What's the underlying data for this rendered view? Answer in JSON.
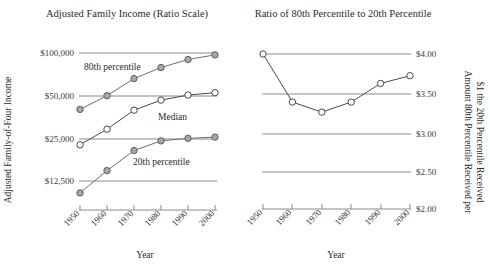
{
  "figure": {
    "left_panel": {
      "title": "Adjusted Family Income (Ratio Scale)",
      "ylabel": "Adjusted Family-of-Four Income",
      "xlabel": "Year"
    },
    "right_panel": {
      "title": "Ratio of 80th Percentile to 20th Percentile",
      "ylabel_line1": "Amount 80th Percentile Received per",
      "ylabel_line2": "$1 the 20th Percentile Received",
      "xlabel": "Year"
    }
  },
  "chart_data": [
    {
      "type": "line",
      "title": "Adjusted Family Income (Ratio Scale)",
      "xlabel": "Year",
      "ylabel": "Adjusted Family-of-Four Income",
      "x": [
        1950,
        1960,
        1970,
        1980,
        1990,
        2000
      ],
      "xtick_labels": [
        "1950",
        "1960",
        "1970",
        "1980",
        "1990",
        "2000"
      ],
      "yscale": "log",
      "ytick_values": [
        12500,
        25000,
        50000,
        100000
      ],
      "ytick_labels": [
        "$12,500",
        "$25,000",
        "$50,000",
        "$100,000"
      ],
      "ylim": [
        10000,
        115000
      ],
      "grid": true,
      "legend": "inline-annotations",
      "series": [
        {
          "name": "80th percentile",
          "marker": "filled-circle",
          "values": [
            40000,
            50000,
            66000,
            79000,
            90000,
            97000
          ]
        },
        {
          "name": "Median",
          "marker": "open-circle",
          "values": [
            22500,
            29000,
            39500,
            46500,
            50500,
            52500
          ]
        },
        {
          "name": "20th percentile",
          "marker": "filled-circle",
          "values": [
            10300,
            14800,
            20500,
            24000,
            25000,
            25500
          ]
        }
      ],
      "annotations": [
        {
          "text": "80th percentile",
          "x": 1955,
          "y": 92000
        },
        {
          "text": "Median",
          "x": 1981,
          "y": 41000
        },
        {
          "text": "20th percentile",
          "x": 1977,
          "y": 20000
        }
      ]
    },
    {
      "type": "line",
      "title": "Ratio of 80th Percentile to 20th Percentile",
      "xlabel": "Year",
      "ylabel": "Amount 80th Percentile Received per $1 the 20th Percentile Received",
      "x": [
        1950,
        1960,
        1970,
        1980,
        1990,
        2000
      ],
      "xtick_labels": [
        "1950",
        "1960",
        "1970",
        "1980",
        "1990",
        "2000"
      ],
      "ytick_values": [
        2.0,
        2.5,
        3.0,
        3.5,
        4.0
      ],
      "ytick_labels": [
        "$2.00",
        "$2.50",
        "$3.00",
        "$3.50",
        "$4.00"
      ],
      "ylim": [
        2.0,
        4.08
      ],
      "grid": true,
      "series": [
        {
          "name": "Ratio of 80th to 20th percentile",
          "marker": "open-circle",
          "values": [
            4.0,
            3.38,
            3.25,
            3.38,
            3.62,
            3.72
          ]
        }
      ]
    }
  ],
  "colors": {
    "gridline": "#8a8a8a",
    "line": "#6e6e6e",
    "marker_fill": "#a8a8a8",
    "marker_stroke": "#5d5d5d",
    "marker_open_fill": "#ffffff",
    "text": "#2b2b2b",
    "background": "#ffffff"
  }
}
